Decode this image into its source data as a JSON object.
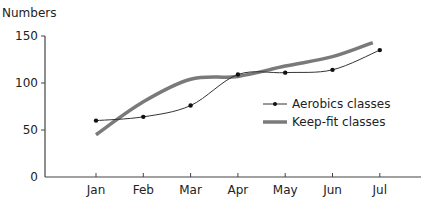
{
  "chart_data": {
    "type": "line",
    "title": "",
    "xlabel": "",
    "ylabel": "Numbers",
    "categories": [
      "Jan",
      "Feb",
      "Mar",
      "Apr",
      "May",
      "Jun",
      "Jul"
    ],
    "yticks": [
      0,
      50,
      100,
      150
    ],
    "ylim": [
      0,
      150
    ],
    "grid": false,
    "legend_position": "inside-right",
    "series": [
      {
        "name": "Aerobics classes",
        "style": "thin line with dot markers",
        "color": "#333333",
        "values": [
          60,
          64,
          76,
          109,
          111,
          114,
          135
        ]
      },
      {
        "name": "Keep-fit classes",
        "style": "thick smooth line",
        "color": "#7a7a7a",
        "values": [
          45,
          80,
          104,
          107,
          118,
          128,
          143
        ]
      }
    ]
  }
}
